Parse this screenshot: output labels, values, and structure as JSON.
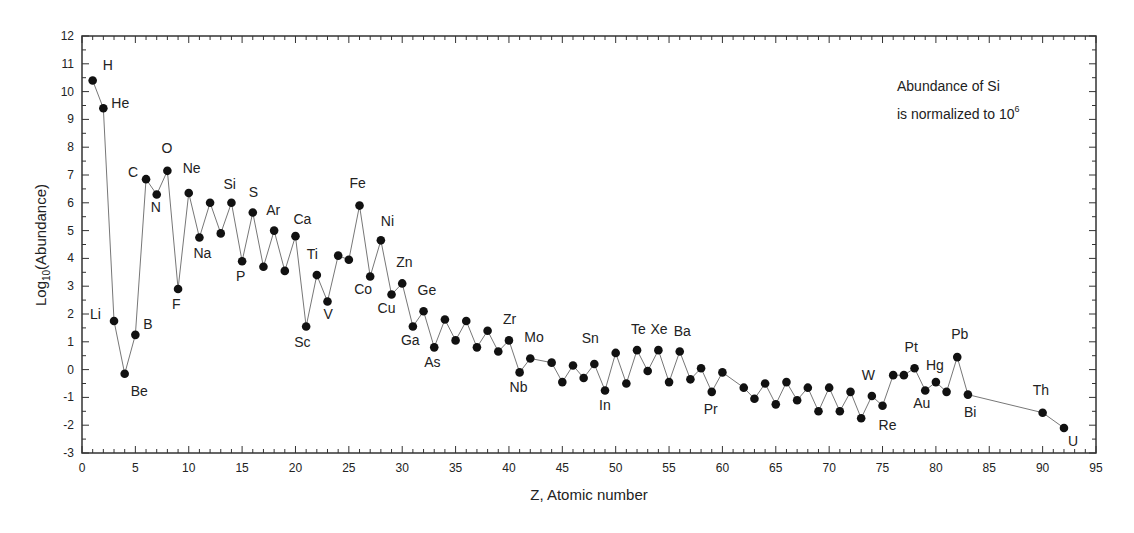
{
  "chart_data": {
    "type": "line",
    "title": "",
    "xlabel": "Z, Atomic number",
    "ylabel_main": "Log",
    "ylabel_sub": "10",
    "ylabel_rest": "(Abundance)",
    "xlim": [
      0,
      95
    ],
    "ylim": [
      -3,
      12
    ],
    "xticks": [
      0,
      5,
      10,
      15,
      20,
      25,
      30,
      35,
      40,
      45,
      50,
      55,
      60,
      65,
      70,
      75,
      80,
      85,
      90,
      95
    ],
    "yticks": [
      -3,
      -2,
      -1,
      0,
      1,
      2,
      3,
      4,
      5,
      6,
      7,
      8,
      9,
      10,
      11,
      12
    ],
    "grid": false,
    "annotation": {
      "line1": "Abundance of Si",
      "line2_prefix": "is normalized to 10",
      "line2_sup": "6"
    },
    "series": [
      {
        "name": "Solar system abundance",
        "marker": "filled-circle",
        "line_color": "#777777",
        "marker_color": "#111111",
        "points": [
          {
            "z": 1,
            "y": 10.4,
            "label": "H"
          },
          {
            "z": 2,
            "y": 9.4,
            "label": "He"
          },
          {
            "z": 3,
            "y": 1.75,
            "label": "Li"
          },
          {
            "z": 4,
            "y": -0.15,
            "label": "Be"
          },
          {
            "z": 5,
            "y": 1.25,
            "label": "B"
          },
          {
            "z": 6,
            "y": 6.85,
            "label": "C"
          },
          {
            "z": 7,
            "y": 6.3,
            "label": "N"
          },
          {
            "z": 8,
            "y": 7.15,
            "label": "O"
          },
          {
            "z": 9,
            "y": 2.9,
            "label": "F"
          },
          {
            "z": 10,
            "y": 6.35,
            "label": "Ne"
          },
          {
            "z": 11,
            "y": 4.75,
            "label": "Na"
          },
          {
            "z": 12,
            "y": 6.0,
            "label": ""
          },
          {
            "z": 13,
            "y": 4.9,
            "label": ""
          },
          {
            "z": 14,
            "y": 6.0,
            "label": "Si"
          },
          {
            "z": 15,
            "y": 3.9,
            "label": "P"
          },
          {
            "z": 16,
            "y": 5.65,
            "label": "S"
          },
          {
            "z": 17,
            "y": 3.7,
            "label": ""
          },
          {
            "z": 18,
            "y": 5.0,
            "label": "Ar"
          },
          {
            "z": 19,
            "y": 3.55,
            "label": ""
          },
          {
            "z": 20,
            "y": 4.8,
            "label": "Ca"
          },
          {
            "z": 21,
            "y": 1.55,
            "label": "Sc"
          },
          {
            "z": 22,
            "y": 3.4,
            "label": "Ti"
          },
          {
            "z": 23,
            "y": 2.45,
            "label": "V"
          },
          {
            "z": 24,
            "y": 4.1,
            "label": ""
          },
          {
            "z": 25,
            "y": 3.95,
            "label": ""
          },
          {
            "z": 26,
            "y": 5.9,
            "label": "Fe"
          },
          {
            "z": 27,
            "y": 3.35,
            "label": "Co"
          },
          {
            "z": 28,
            "y": 4.65,
            "label": "Ni"
          },
          {
            "z": 29,
            "y": 2.7,
            "label": "Cu"
          },
          {
            "z": 30,
            "y": 3.1,
            "label": "Zn"
          },
          {
            "z": 31,
            "y": 1.55,
            "label": "Ga"
          },
          {
            "z": 32,
            "y": 2.1,
            "label": "Ge"
          },
          {
            "z": 33,
            "y": 0.8,
            "label": "As"
          },
          {
            "z": 34,
            "y": 1.8,
            "label": ""
          },
          {
            "z": 35,
            "y": 1.05,
            "label": ""
          },
          {
            "z": 36,
            "y": 1.75,
            "label": ""
          },
          {
            "z": 37,
            "y": 0.8,
            "label": ""
          },
          {
            "z": 38,
            "y": 1.4,
            "label": ""
          },
          {
            "z": 39,
            "y": 0.65,
            "label": ""
          },
          {
            "z": 40,
            "y": 1.05,
            "label": "Zr"
          },
          {
            "z": 41,
            "y": -0.1,
            "label": "Nb"
          },
          {
            "z": 42,
            "y": 0.4,
            "label": "Mo"
          },
          {
            "z": 44,
            "y": 0.25,
            "label": ""
          },
          {
            "z": 45,
            "y": -0.45,
            "label": ""
          },
          {
            "z": 46,
            "y": 0.15,
            "label": ""
          },
          {
            "z": 47,
            "y": -0.3,
            "label": ""
          },
          {
            "z": 48,
            "y": 0.2,
            "label": "Sn_pre"
          },
          {
            "z": 49,
            "y": -0.75,
            "label": "In"
          },
          {
            "z": 50,
            "y": 0.6,
            "label": "Sn"
          },
          {
            "z": 51,
            "y": -0.5,
            "label": ""
          },
          {
            "z": 52,
            "y": 0.7,
            "label": "Te"
          },
          {
            "z": 53,
            "y": -0.05,
            "label": ""
          },
          {
            "z": 54,
            "y": 0.7,
            "label": "Xe"
          },
          {
            "z": 55,
            "y": -0.45,
            "label": ""
          },
          {
            "z": 56,
            "y": 0.65,
            "label": "Ba"
          },
          {
            "z": 57,
            "y": -0.35,
            "label": ""
          },
          {
            "z": 58,
            "y": 0.05,
            "label": ""
          },
          {
            "z": 59,
            "y": -0.8,
            "label": "Pr"
          },
          {
            "z": 60,
            "y": -0.1,
            "label": ""
          },
          {
            "z": 62,
            "y": -0.65,
            "label": ""
          },
          {
            "z": 63,
            "y": -1.05,
            "label": ""
          },
          {
            "z": 64,
            "y": -0.5,
            "label": ""
          },
          {
            "z": 65,
            "y": -1.25,
            "label": ""
          },
          {
            "z": 66,
            "y": -0.45,
            "label": ""
          },
          {
            "z": 67,
            "y": -1.1,
            "label": ""
          },
          {
            "z": 68,
            "y": -0.65,
            "label": ""
          },
          {
            "z": 69,
            "y": -1.5,
            "label": ""
          },
          {
            "z": 70,
            "y": -0.65,
            "label": ""
          },
          {
            "z": 71,
            "y": -1.5,
            "label": ""
          },
          {
            "z": 72,
            "y": -0.8,
            "label": ""
          },
          {
            "z": 73,
            "y": -1.75,
            "label": ""
          },
          {
            "z": 74,
            "y": -0.95,
            "label": "W"
          },
          {
            "z": 75,
            "y": -1.3,
            "label": "Re"
          },
          {
            "z": 76,
            "y": -0.2,
            "label": ""
          },
          {
            "z": 77,
            "y": -0.2,
            "label": ""
          },
          {
            "z": 78,
            "y": 0.05,
            "label": "Pt"
          },
          {
            "z": 79,
            "y": -0.75,
            "label": "Au"
          },
          {
            "z": 80,
            "y": -0.45,
            "label": "Hg"
          },
          {
            "z": 81,
            "y": -0.8,
            "label": ""
          },
          {
            "z": 82,
            "y": 0.45,
            "label": "Pb"
          },
          {
            "z": 83,
            "y": -0.9,
            "label": "Bi"
          },
          {
            "z": 90,
            "y": -1.55,
            "label": "Th"
          },
          {
            "z": 92,
            "y": -2.1,
            "label": "U"
          }
        ]
      }
    ],
    "labels": [
      {
        "text": "H",
        "dx": 10,
        "dy": -10
      },
      {
        "text": "He",
        "dx": 8,
        "dy": 0
      },
      {
        "text": "Li",
        "dx": -24,
        "dy": -2
      },
      {
        "text": "Be",
        "dx": 6,
        "dy": 22
      },
      {
        "text": "B",
        "dx": 8,
        "dy": -6
      },
      {
        "text": "C",
        "dx": -18,
        "dy": -2
      },
      {
        "text": "N",
        "dx": -6,
        "dy": 18
      },
      {
        "text": "O",
        "dx": -6,
        "dy": -18
      },
      {
        "text": "F",
        "dx": -6,
        "dy": 20
      },
      {
        "text": "Ne",
        "dx": -6,
        "dy": -20
      },
      {
        "text": "Na",
        "dx": -6,
        "dy": 20
      },
      {
        "text": "Si",
        "dx": -8,
        "dy": -14
      },
      {
        "text": "P",
        "dx": -6,
        "dy": 20
      },
      {
        "text": "S",
        "dx": -4,
        "dy": -16
      },
      {
        "text": "Ar",
        "dx": -8,
        "dy": -16
      },
      {
        "text": "Ca",
        "dx": -2,
        "dy": -12
      },
      {
        "text": "Sc",
        "dx": -12,
        "dy": 20
      },
      {
        "text": "Ti",
        "dx": -10,
        "dy": -16
      },
      {
        "text": "V",
        "dx": -4,
        "dy": 18
      },
      {
        "text": "Fe",
        "dx": -10,
        "dy": -18
      },
      {
        "text": "Co",
        "dx": -16,
        "dy": 18
      },
      {
        "text": "Ni",
        "dx": 0,
        "dy": -14
      },
      {
        "text": "Cu",
        "dx": -14,
        "dy": 18
      },
      {
        "text": "Zn",
        "dx": -6,
        "dy": -16
      },
      {
        "text": "Ga",
        "dx": -12,
        "dy": 18
      },
      {
        "text": "Ge",
        "dx": -6,
        "dy": -16
      },
      {
        "text": "As",
        "dx": -10,
        "dy": 20
      },
      {
        "text": "Zr",
        "dx": -6,
        "dy": -16
      },
      {
        "text": "Nb",
        "dx": -10,
        "dy": 20
      },
      {
        "text": "Mo",
        "dx": -6,
        "dy": -16
      },
      {
        "text": "In",
        "dx": -6,
        "dy": 20
      },
      {
        "text": "Sn",
        "dx": -34,
        "dy": -10
      },
      {
        "text": "Te",
        "dx": -6,
        "dy": -16
      },
      {
        "text": "Xe",
        "dx": -8,
        "dy": -16
      },
      {
        "text": "Ba",
        "dx": -6,
        "dy": -16
      },
      {
        "text": "Pr",
        "dx": -8,
        "dy": 22
      },
      {
        "text": "W",
        "dx": -10,
        "dy": -16
      },
      {
        "text": "Re",
        "dx": -4,
        "dy": 24
      },
      {
        "text": "Pt",
        "dx": -10,
        "dy": -16
      },
      {
        "text": "Au",
        "dx": -12,
        "dy": 18
      },
      {
        "text": "Hg",
        "dx": -10,
        "dy": -12
      },
      {
        "text": "Pb",
        "dx": -6,
        "dy": -18
      },
      {
        "text": "Bi",
        "dx": -4,
        "dy": 22
      },
      {
        "text": "Th",
        "dx": -10,
        "dy": -18
      },
      {
        "text": "U",
        "dx": 4,
        "dy": 18
      }
    ]
  }
}
